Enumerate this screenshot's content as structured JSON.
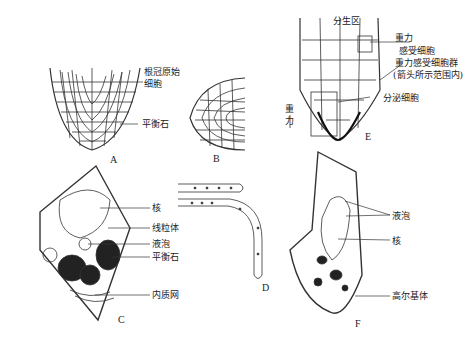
{
  "figure": {
    "panels": {
      "A": {
        "letter": "A",
        "labels": {
          "root_cap_initial_1": "根冠原始",
          "root_cap_initial_2": "细胞",
          "statolith": "平衡石"
        }
      },
      "B": {
        "letter": "B"
      },
      "C": {
        "letter": "C",
        "labels": {
          "nucleus": "核",
          "mitochondria": "线粒体",
          "vacuole": "液泡",
          "statolith": "平衡石",
          "er": "内质网"
        }
      },
      "D": {
        "letter": "D"
      },
      "E": {
        "letter": "E",
        "labels": {
          "meristem": "分生区",
          "gravity_1": "重力",
          "gravity_2": "感受细胞",
          "gravity_group": "重力感受细胞群",
          "gravity_group_note": "(箭头所示范围内)",
          "secretory": "分泌细胞",
          "gravity_arrow_1": "重",
          "gravity_arrow_2": "力"
        }
      },
      "F": {
        "letter": "F",
        "labels": {
          "vacuole": "液泡",
          "nucleus": "核",
          "golgi": "高尔基体"
        }
      }
    }
  }
}
